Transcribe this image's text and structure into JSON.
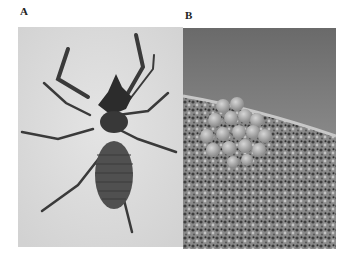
{
  "figure": {
    "panels": [
      {
        "label": "A",
        "subject": "arachnid specimen, dorsal view",
        "background": "#dcdcdc"
      },
      {
        "label": "B",
        "subject": "egg cluster on gravel substrate",
        "background": "#6e6e6e"
      }
    ]
  }
}
